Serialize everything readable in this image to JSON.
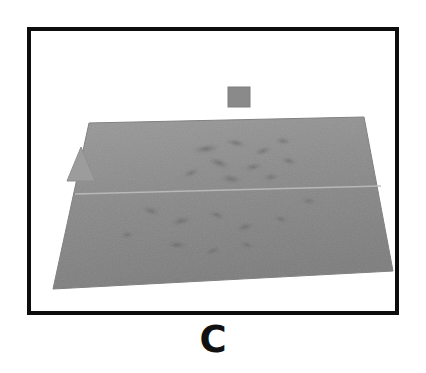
{
  "figure": {
    "caption": "C",
    "panel_label": "C",
    "background_color": "#ffffff",
    "frame_color": "#0d0d0d",
    "frame_thickness_px": 4
  },
  "scene": {
    "description": "Grayscale 3D perspective rendering of a rough terrain-like surface patch viewed obliquely",
    "surface": {
      "name": "terrain-surface",
      "fill_color": "#8c8c8c",
      "shade_light": "#a6a6a6",
      "shade_dark": "#6e6e6e",
      "outline_color": "#7a7a7a",
      "corners": [
        {
          "x": 58,
          "y": 92
        },
        {
          "x": 333,
          "y": 86
        },
        {
          "x": 362,
          "y": 240
        },
        {
          "x": 22,
          "y": 258
        }
      ],
      "seam_line": {
        "name": "horizontal-seam",
        "from": {
          "x": 44,
          "y": 163
        },
        "to": {
          "x": 350,
          "y": 155
        },
        "color": "#b8b8b8"
      }
    },
    "markers": [
      {
        "name": "top-cube-marker",
        "shape": "square",
        "color": "#8a8a8a",
        "x": 197,
        "y": 56,
        "width": 22,
        "height": 20
      },
      {
        "name": "left-triangle-marker",
        "shape": "triangle",
        "color": "#9a9a9a",
        "x": 36,
        "y": 116,
        "width": 28,
        "height": 34
      }
    ],
    "texture_blobs": [
      {
        "x": 175,
        "y": 118,
        "rx": 16,
        "ry": 5,
        "rot": -8,
        "tone": "#6f6f6f"
      },
      {
        "x": 205,
        "y": 112,
        "rx": 13,
        "ry": 4,
        "rot": 12,
        "tone": "#6a6a6a"
      },
      {
        "x": 232,
        "y": 120,
        "rx": 11,
        "ry": 4,
        "rot": -18,
        "tone": "#767676"
      },
      {
        "x": 252,
        "y": 110,
        "rx": 9,
        "ry": 4,
        "rot": 6,
        "tone": "#707070"
      },
      {
        "x": 188,
        "y": 132,
        "rx": 14,
        "ry": 5,
        "rot": 20,
        "tone": "#757575"
      },
      {
        "x": 222,
        "y": 136,
        "rx": 12,
        "ry": 4,
        "rot": -10,
        "tone": "#6d6d6d"
      },
      {
        "x": 258,
        "y": 130,
        "rx": 10,
        "ry": 4,
        "rot": 15,
        "tone": "#787878"
      },
      {
        "x": 160,
        "y": 142,
        "rx": 11,
        "ry": 4,
        "rot": -22,
        "tone": "#737373"
      },
      {
        "x": 200,
        "y": 148,
        "rx": 13,
        "ry": 5,
        "rot": 8,
        "tone": "#6b6b6b"
      },
      {
        "x": 240,
        "y": 146,
        "rx": 10,
        "ry": 4,
        "rot": -6,
        "tone": "#777777"
      },
      {
        "x": 120,
        "y": 180,
        "rx": 12,
        "ry": 5,
        "rot": 14,
        "tone": "#747474"
      },
      {
        "x": 150,
        "y": 190,
        "rx": 14,
        "ry": 5,
        "rot": -12,
        "tone": "#6e6e6e"
      },
      {
        "x": 186,
        "y": 184,
        "rx": 11,
        "ry": 4,
        "rot": 18,
        "tone": "#797979"
      },
      {
        "x": 214,
        "y": 196,
        "rx": 13,
        "ry": 5,
        "rot": -16,
        "tone": "#717171"
      },
      {
        "x": 250,
        "y": 188,
        "rx": 10,
        "ry": 4,
        "rot": 10,
        "tone": "#7a7a7a"
      },
      {
        "x": 146,
        "y": 214,
        "rx": 15,
        "ry": 5,
        "rot": 6,
        "tone": "#6c6c6c"
      },
      {
        "x": 182,
        "y": 220,
        "rx": 12,
        "ry": 4,
        "rot": -20,
        "tone": "#757575"
      },
      {
        "x": 216,
        "y": 214,
        "rx": 10,
        "ry": 4,
        "rot": 12,
        "tone": "#787878"
      },
      {
        "x": 96,
        "y": 204,
        "rx": 9,
        "ry": 4,
        "rot": -8,
        "tone": "#7b7b7b"
      },
      {
        "x": 278,
        "y": 170,
        "rx": 9,
        "ry": 4,
        "rot": 4,
        "tone": "#7c7c7c"
      }
    ]
  }
}
